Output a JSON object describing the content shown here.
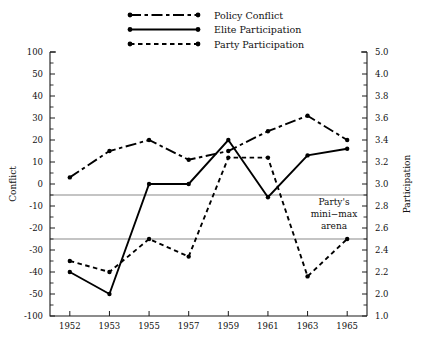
{
  "chart_data": {
    "type": "line",
    "title": "",
    "xlabel": "",
    "ylabel": "Conflict",
    "y2label": "Participation",
    "categories": [
      "1952",
      "1953",
      "1955",
      "1957",
      "1959",
      "1961",
      "1963",
      "1965"
    ],
    "yticks": [
      100,
      50,
      40,
      30,
      20,
      10,
      0,
      -10,
      -20,
      -30,
      -40,
      -50,
      -100
    ],
    "ytick_labels": [
      "100",
      "50",
      "40",
      "30",
      "20",
      "10",
      "0",
      "-10",
      "-20",
      "-30",
      "-40",
      "-50",
      "-100"
    ],
    "y2tick_labels": [
      "5.0",
      "4.0",
      "3.8",
      "3.6",
      "3.4",
      "3.2",
      "3.0",
      "2.8",
      "2.6",
      "2.4",
      "2.2",
      "2.0",
      "1.0"
    ],
    "ylim": [
      -100,
      100
    ],
    "grid": false,
    "scale_note": "piecewise-linear: equal pixel spacing between each labeled tick",
    "legend_position": "top-center",
    "series": [
      {
        "name": "Policy Conflict",
        "style": "dash-dot",
        "values": [
          3,
          15,
          20,
          11,
          15,
          24,
          31,
          20
        ]
      },
      {
        "name": "Elite Participation",
        "style": "solid",
        "values": [
          -40,
          -50,
          0,
          0,
          20,
          -6,
          13,
          16
        ]
      },
      {
        "name": "Party Participation",
        "style": "dotted",
        "values": [
          -35,
          -40,
          -25,
          -33,
          12,
          12,
          -42,
          -25
        ]
      }
    ],
    "reference_lines": [
      {
        "value": -5,
        "color": "#8a8a8a"
      },
      {
        "value": -25,
        "color": "#8a8a8a"
      }
    ],
    "annotations": [
      {
        "name": "party-minimax-arena",
        "lines": [
          "Party's",
          "mini−max",
          "arena"
        ]
      }
    ]
  },
  "colors": {
    "series": "#000000",
    "reference": "#8a8a8a",
    "axis": "#1a1a1a",
    "background": "#ffffff"
  }
}
